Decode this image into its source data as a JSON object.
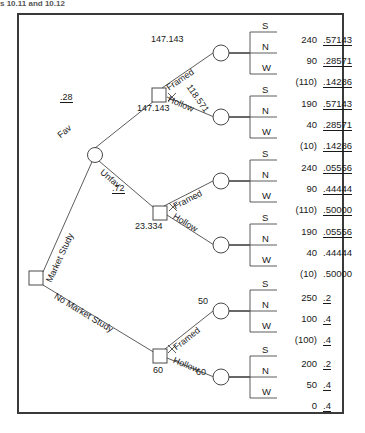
{
  "header": {
    "text": "s 10.11 and 10.12"
  },
  "diagram": {
    "type": "decision-tree",
    "root": {
      "node_type": "decision",
      "label": ""
    },
    "branch_labels": {
      "market_study": "Market Study",
      "no_market_study": "No Market Study",
      "fav": "Fav",
      "unfav": "Unfav",
      "framed": "Framed",
      "hollow": "Hollow"
    },
    "probabilities": {
      "fav": ".28",
      "unfav": ".72"
    },
    "node_values": {
      "fav_decision": "147.143",
      "fav_framed_chance": "147.143",
      "fav_hollow_chance": "118.571",
      "unfav_decision": "23.334",
      "no_study_decision": "60",
      "no_study_framed_chance": "50",
      "no_study_hollow_chance": "60"
    },
    "outcome_labels": [
      "S",
      "N",
      "W"
    ],
    "groups": [
      {
        "id": "fav-framed",
        "parent": "Framed",
        "value": "147.143",
        "rows": [
          {
            "outcome": "S",
            "payoff": "240",
            "prob": ".57143",
            "underline": true
          },
          {
            "outcome": "N",
            "payoff": "90",
            "prob": ".28571",
            "underline": true
          },
          {
            "outcome": "W",
            "payoff": "(110)",
            "prob": ".14286",
            "underline": true
          }
        ]
      },
      {
        "id": "fav-hollow",
        "parent": "Hollow",
        "value": "118.571",
        "rows": [
          {
            "outcome": "S",
            "payoff": "190",
            "prob": ".57143",
            "underline": true
          },
          {
            "outcome": "N",
            "payoff": "40",
            "prob": ".28571",
            "underline": true
          },
          {
            "outcome": "W",
            "payoff": "(10)",
            "prob": ".14286",
            "underline": true
          }
        ]
      },
      {
        "id": "unfav-framed",
        "parent": "Framed",
        "value": "",
        "rows": [
          {
            "outcome": "S",
            "payoff": "240",
            "prob": ".05556",
            "underline": true
          },
          {
            "outcome": "N",
            "payoff": "90",
            "prob": ".44444",
            "underline": true
          },
          {
            "outcome": "W",
            "payoff": "(110)",
            "prob": ".50000",
            "underline": true
          }
        ]
      },
      {
        "id": "unfav-hollow",
        "parent": "Hollow",
        "value": "",
        "rows": [
          {
            "outcome": "S",
            "payoff": "190",
            "prob": ".05556",
            "underline": true
          },
          {
            "outcome": "N",
            "payoff": "40",
            "prob": ".44444",
            "underline": false
          },
          {
            "outcome": "W",
            "payoff": "(10)",
            "prob": ".50000",
            "underline": false
          }
        ]
      },
      {
        "id": "nostudy-framed",
        "parent": "Framed",
        "value": "50",
        "rows": [
          {
            "outcome": "S",
            "payoff": "250",
            "prob": ".2",
            "underline": true
          },
          {
            "outcome": "N",
            "payoff": "100",
            "prob": ".4",
            "underline": true
          },
          {
            "outcome": "W",
            "payoff": "(100)",
            "prob": ".4",
            "underline": true
          }
        ]
      },
      {
        "id": "nostudy-hollow",
        "parent": "Hollow",
        "value": "60",
        "rows": [
          {
            "outcome": "S",
            "payoff": "200",
            "prob": ".2",
            "underline": true
          },
          {
            "outcome": "N",
            "payoff": "50",
            "prob": ".4",
            "underline": true
          },
          {
            "outcome": "W",
            "payoff": "0",
            "prob": ".4",
            "underline": true
          }
        ]
      }
    ]
  }
}
